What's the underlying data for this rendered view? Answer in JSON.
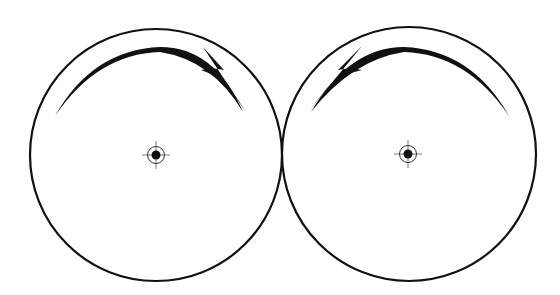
{
  "diagram": {
    "stroke_color": "#111111",
    "background": "#ffffff",
    "wheels": [
      {
        "id": "left-wheel",
        "center": [
          156,
          155
        ],
        "radius": 126,
        "rotation": "clockwise",
        "axle_marker": "center-crosshair"
      },
      {
        "id": "right-wheel",
        "center": [
          409,
          154
        ],
        "radius": 127,
        "rotation": "counter-clockwise",
        "axle_marker": "center-crosshair"
      }
    ],
    "contact_point": [
      283,
      155
    ]
  }
}
